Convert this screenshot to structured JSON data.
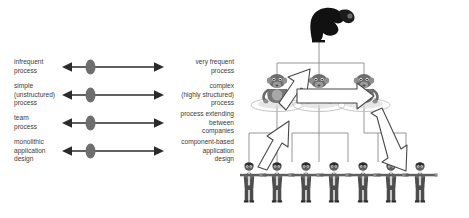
{
  "figure": {
    "background_color": "#ffffff",
    "ink_color": "#2b2b2b",
    "marker_color": "#6e6e6e",
    "line_color": "#8a8a8a",
    "block_arrow_fill": "#ffffff",
    "block_arrow_stroke": "#4a4a4a"
  },
  "spectrum": {
    "rows": [
      {
        "left_label": "infrequent\nprocess",
        "right_label": "very frequent\nprocess",
        "marker_position_percent": 28
      },
      {
        "left_label": "simple\n(unstructured)\nprocess",
        "right_label": "complex\n(highly structured)\nprocess",
        "marker_position_percent": 28
      },
      {
        "left_label": "team\nprocess",
        "right_label": "process extending\nbetween\ncompanies",
        "marker_position_percent": 28
      },
      {
        "left_label": "monolithic\napplication\ndesign",
        "right_label": "component-based\napplication\ndesign",
        "marker_position_percent": 28
      }
    ]
  },
  "hierarchy": {
    "levels": [
      {
        "name": "executive",
        "count": 1,
        "style": "dark-silhouette-figure"
      },
      {
        "name": "managers",
        "count": 3,
        "style": "gray-seated-figure"
      },
      {
        "name": "workers",
        "count": 7,
        "style": "gray-standing-figure-linked-arms"
      }
    ],
    "block_arrows": [
      {
        "name": "escalation-arrow",
        "direction": "up-right",
        "from": "managers",
        "to": "executive"
      },
      {
        "name": "peer-handoff-arrow",
        "direction": "right",
        "from": "manager-left",
        "to": "manager-right"
      },
      {
        "name": "bottom-up-arrow",
        "direction": "up-right",
        "from": "workers",
        "to": "manager-left"
      },
      {
        "name": "top-down-arrow",
        "direction": "down-right",
        "from": "manager-right",
        "to": "workers"
      }
    ]
  }
}
